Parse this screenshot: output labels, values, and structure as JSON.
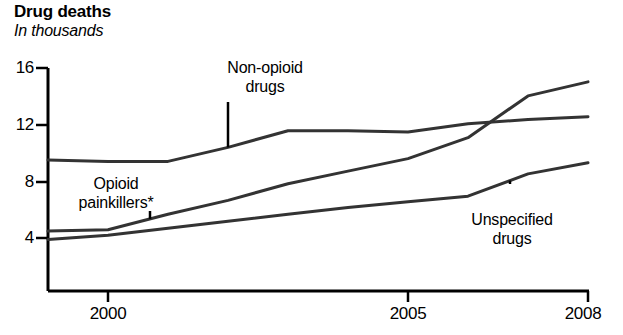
{
  "chart_data": {
    "type": "line",
    "title": "Drug deaths",
    "subtitle": "In thousands",
    "xlabel": "",
    "ylabel": "",
    "unit": "thousands",
    "grid": false,
    "legend_position": "inline-annotations",
    "xlim": [
      1999,
      2008
    ],
    "ylim": [
      0,
      16
    ],
    "yticks": [
      4,
      8,
      12,
      16
    ],
    "ytick_labels": [
      "4",
      "8",
      "12",
      "16"
    ],
    "xticks": [
      2000,
      2005,
      2008
    ],
    "xtick_labels": [
      "2000",
      "2005",
      "2008"
    ],
    "x": [
      1999,
      2000,
      2001,
      2002,
      2003,
      2004,
      2005,
      2006,
      2007,
      2008
    ],
    "series": [
      {
        "name": "Non-opioid drugs",
        "label": "Non-opioid",
        "label_line2": "drugs",
        "values": [
          9.4,
          9.3,
          9.3,
          10.3,
          11.5,
          11.5,
          11.4,
          12.0,
          12.3,
          12.5
        ]
      },
      {
        "name": "Opioid painkillers*",
        "label": "Opioid",
        "label_line2": "painkillers*",
        "values": [
          4.3,
          4.4,
          5.5,
          6.5,
          7.7,
          8.6,
          9.5,
          11.0,
          14.0,
          15.0
        ]
      },
      {
        "name": "Unspecified drugs",
        "label": "Unspecified",
        "label_line2": "drugs",
        "values": [
          3.7,
          4.0,
          4.5,
          5.0,
          5.5,
          6.0,
          6.4,
          6.8,
          8.4,
          9.2
        ]
      }
    ],
    "annotations": [
      {
        "text": "Non-opioid drugs",
        "points_to_series": "Non-opioid drugs",
        "points_to_x": 2002
      },
      {
        "text": "Opioid painkillers*",
        "points_to_series": "Opioid painkillers*",
        "points_to_x": 2000.7
      },
      {
        "text": "Unspecified drugs",
        "points_to_series": "Unspecified drugs",
        "points_to_x": 2006.7
      }
    ],
    "colors": {
      "line": "#333333",
      "axis": "#000000",
      "text": "#000000",
      "background": "#ffffff"
    }
  }
}
